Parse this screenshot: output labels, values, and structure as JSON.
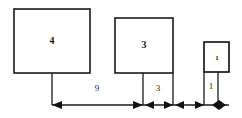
{
  "diagram": {
    "type": "dimensioned-square-diagram",
    "background_color": "#ffffff",
    "line_color": "#1a1a1a",
    "shapes": [
      {
        "name": "large-square",
        "label": "4",
        "x": 14,
        "y": 9,
        "width": 76,
        "height": 64
      },
      {
        "name": "medium-square",
        "label": "3",
        "x": 115,
        "y": 18,
        "width": 58,
        "height": 55
      },
      {
        "name": "small-square",
        "label": "1",
        "x": 204,
        "y": 42,
        "width": 25,
        "height": 30
      }
    ],
    "dimensions": [
      {
        "name": "dimension-9",
        "label": "9",
        "from_x": 52,
        "to_x": 143,
        "label_x": 97,
        "label_y": 89
      },
      {
        "name": "dimension-3",
        "label": "3",
        "from_x": 143,
        "to_x": 173,
        "label_x": 158,
        "label_y": 89
      },
      {
        "name": "dimension-1",
        "label": "1",
        "from_x": 204,
        "to_x": 218,
        "label_x": 211,
        "label_y": 87
      }
    ],
    "dimension_line_y": 105,
    "extension_lines": [
      {
        "name": "extension-line-1",
        "x": 52,
        "y_top": 73,
        "y_bottom": 105
      },
      {
        "name": "extension-line-2",
        "x": 143,
        "y_top": 73,
        "y_bottom": 105
      },
      {
        "name": "extension-line-3",
        "x": 173,
        "y_top": 73,
        "y_bottom": 105
      },
      {
        "name": "extension-line-4",
        "x": 204,
        "y_top": 72,
        "y_bottom": 105
      },
      {
        "name": "extension-line-5",
        "x": 218,
        "y_top": 72,
        "y_bottom": 105
      }
    ]
  }
}
